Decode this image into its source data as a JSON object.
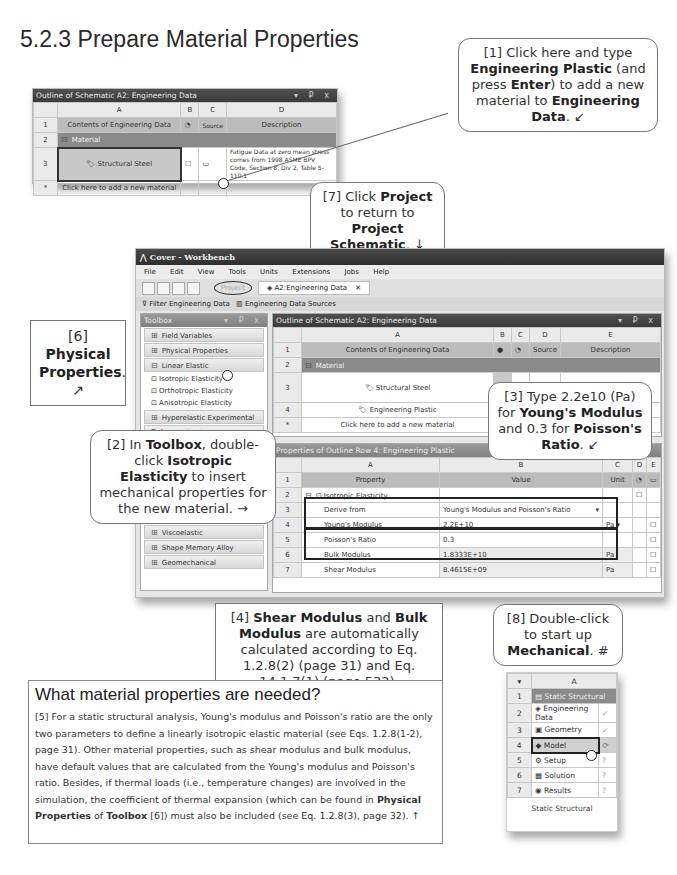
{
  "page": {
    "section_title": "5.2.3 Prepare Material Properties",
    "page_header": "Chapter 5  Bookshelf"
  },
  "top_outline": {
    "title": "Outline of Schematic A2: Engineering Data",
    "controls": "▾ ₽ x",
    "col_headers": [
      "",
      "A",
      "B",
      "C",
      "D"
    ],
    "rows": [
      {
        "num": "1",
        "a": "Contents of Engineering Data",
        "c": "Source",
        "d": "Description"
      },
      {
        "num": "2",
        "a": "Material"
      },
      {
        "num": "3",
        "a": "Structural Steel",
        "d": "Fatigue Data at zero mean stress comes from 1998 ASME BPV Code, Section 8, Div 2, Table 5-110.1"
      },
      {
        "num": "*",
        "a": "Click here to add a new material"
      }
    ]
  },
  "callouts": {
    "c1": {
      "pre": "[1] Click here and type ",
      "b1": "Engineering Plastic",
      "mid": " (and press ",
      "b2": "Enter",
      "mid2": ") to add a new material to ",
      "b3": "Engineering Data",
      "post": ". ↙"
    },
    "c2": {
      "pre": "[2] In ",
      "b1": "Toolbox",
      "mid": ", double-click ",
      "b2": "Isotropic Elasticity",
      "post": " to insert mechanical properties for the new material. →"
    },
    "c3": {
      "pre": "[3] Type 2.2e10 (Pa) for ",
      "b1": "Young's Modulus",
      "mid": " and 0.3 for ",
      "b2": "Poisson's Ratio",
      "post": ". ↙"
    },
    "c4": {
      "pre": "[4] ",
      "b1": "Shear Modulus",
      "mid": " and ",
      "b2": "Bulk Modulus",
      "post": " are automatically calculated according to Eq. 1.2.8(2) (page 31) and Eq. 14.1.7(1) (page 532), respectively. ↓"
    },
    "c6": {
      "pre": "[6] ",
      "b1": "Physical Properties",
      "post": ". ↗"
    },
    "c7": {
      "pre": "[7] Click ",
      "b1": "Project",
      "mid": " to return to ",
      "b2": "Project Schematic",
      "post": ". ↓"
    },
    "c8": {
      "pre": "[8] Double-click to start up ",
      "b1": "Mechanical",
      "post": ". #"
    }
  },
  "workbench": {
    "window_title": "Cover - Workbench",
    "menu": [
      "File",
      "Edit",
      "View",
      "Tools",
      "Units",
      "Extensions",
      "Jobs",
      "Help"
    ],
    "tabs": [
      {
        "label": "Project"
      },
      {
        "label": "A2:Engineering Data",
        "close": "✕"
      }
    ],
    "toolbar2": [
      "Filter Engineering Data",
      "Engineering Data Sources"
    ],
    "toolbox": {
      "title": "Toolbox",
      "controls": "▾ ₽ x",
      "groups_top": [
        "Field Variables",
        "Physical Properties",
        "Linear Elastic"
      ],
      "linear_elastic_items": [
        "Isotropic Elasticity",
        "Orthotropic Elasticity",
        "Anisotropic Elasticity"
      ],
      "groups_mid": [
        "Hyperelastic Experimental Data",
        "Hyperelastic"
      ],
      "groups_bottom": [
        "Creep",
        "Viscoelastic Test Data",
        "Viscoelastic",
        "Shape Memory Alloy",
        "Geomechanical"
      ]
    },
    "outline": {
      "title": "Outline of Schematic A2: Engineering Data",
      "controls": "▾ ₽ x",
      "col_headers": [
        "",
        "A",
        "B",
        "C",
        "D",
        "E"
      ],
      "rows": [
        {
          "num": "1",
          "a": "Contents of Engineering Data",
          "d": "Source",
          "e": "Description"
        },
        {
          "num": "2",
          "a": "Material"
        },
        {
          "num": "3",
          "a": "Structural Steel",
          "e": "Fatigue Data at zero mean stress"
        },
        {
          "num": "4",
          "a": "Engineering Plastic"
        },
        {
          "num": "*",
          "a": "Click here to add a new material"
        }
      ]
    },
    "properties": {
      "title": "Properties of Outline Row 4: Engineering Plastic",
      "col_headers": [
        "",
        "A",
        "B",
        "C",
        "D",
        "E"
      ],
      "rows": [
        {
          "num": "1",
          "a": "Property",
          "b": "Value",
          "c": "Unit"
        },
        {
          "num": "2",
          "a": "Isotropic Elasticity",
          "b": "",
          "c": ""
        },
        {
          "num": "3",
          "a": "Derive from",
          "b": "Young's Modulus and Poisson's Ratio",
          "c": ""
        },
        {
          "num": "4",
          "a": "Young's Modulus",
          "b": "2.2E+10",
          "c": "Pa"
        },
        {
          "num": "5",
          "a": "Poisson's Ratio",
          "b": "0.3",
          "c": ""
        },
        {
          "num": "6",
          "a": "Bulk Modulus",
          "b": "1.8333E+10",
          "c": "Pa"
        },
        {
          "num": "7",
          "a": "Shear Modulus",
          "b": "8.4615E+09",
          "c": "Pa"
        }
      ]
    }
  },
  "note": {
    "title": "What material properties are needed?",
    "p1": "[5] For a static structural analysis, Young's modulus and Poisson's ratio are the only two parameters to define a linearly isotropic elastic material (see Eqs. 1.2.8(1-2), page 31).  Other material properties, such as shear modulus and bulk modulus, have default values that are calculated from the Young's modulus and Poisson's ratio.  Besides, if thermal loads (i.e., temperature changes) are involved in the simulation, the coefficient of thermal expansion (which can be found in ",
    "b1": "Physical Properties",
    "p2": " of ",
    "b2": "Toolbox",
    "p3": " [6]) must also be included (see Eq. 1.2.8(3), page 32). ↑"
  },
  "system": {
    "col": "A",
    "rows": [
      {
        "num": "1",
        "label": "Static Structural",
        "status": ""
      },
      {
        "num": "2",
        "label": "Engineering Data",
        "status": "✓"
      },
      {
        "num": "3",
        "label": "Geometry",
        "status": "✓"
      },
      {
        "num": "4",
        "label": "Model",
        "status": "⟳"
      },
      {
        "num": "5",
        "label": "Setup",
        "status": "?"
      },
      {
        "num": "6",
        "label": "Solution",
        "status": "?"
      },
      {
        "num": "7",
        "label": "Results",
        "status": "?"
      }
    ],
    "caption": "Static Structural"
  }
}
